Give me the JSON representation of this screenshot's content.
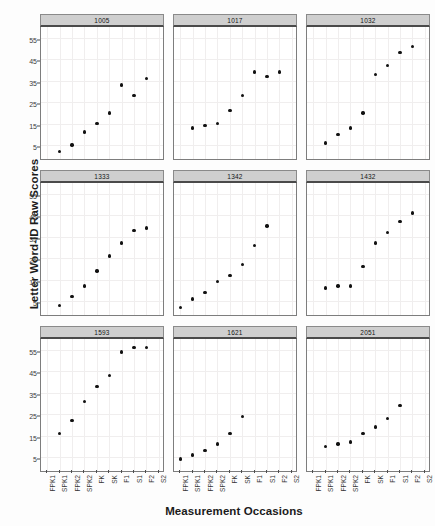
{
  "chart_data": {
    "type": "scatter",
    "title": "",
    "xlabel": "Measurement Occasions",
    "ylabel": "Letter Word-ID Raw Scores",
    "ylim": [
      -2,
      60
    ],
    "yticks": [
      5,
      15,
      25,
      35,
      45,
      55
    ],
    "grid": true,
    "legend_position": "none",
    "facet_layout": {
      "rows": 3,
      "cols": 3
    },
    "categories": [
      "FPK1",
      "SPK1",
      "FPK2",
      "SPK2",
      "FK",
      "SK",
      "F1",
      "S1",
      "F2",
      "S2"
    ],
    "panels": [
      {
        "label": "1005",
        "points": [
          {
            "x": "SPK1",
            "y": 2
          },
          {
            "x": "FPK2",
            "y": 5
          },
          {
            "x": "SPK2",
            "y": 11
          },
          {
            "x": "FK",
            "y": 15
          },
          {
            "x": "SK",
            "y": 20
          },
          {
            "x": "F1",
            "y": 33
          },
          {
            "x": "S1",
            "y": 28
          },
          {
            "x": "F2",
            "y": 36
          }
        ]
      },
      {
        "label": "1017",
        "points": [
          {
            "x": "SPK1",
            "y": 13
          },
          {
            "x": "FPK2",
            "y": 14
          },
          {
            "x": "SPK2",
            "y": 15
          },
          {
            "x": "FK",
            "y": 21
          },
          {
            "x": "SK",
            "y": 28
          },
          {
            "x": "F1",
            "y": 39
          },
          {
            "x": "S1",
            "y": 37
          },
          {
            "x": "F2",
            "y": 39
          }
        ]
      },
      {
        "label": "1032",
        "points": [
          {
            "x": "SPK1",
            "y": 6
          },
          {
            "x": "FPK2",
            "y": 10
          },
          {
            "x": "SPK2",
            "y": 13
          },
          {
            "x": "FK",
            "y": 20
          },
          {
            "x": "SK",
            "y": 38
          },
          {
            "x": "F1",
            "y": 42
          },
          {
            "x": "S1",
            "y": 48
          },
          {
            "x": "F2",
            "y": 51
          }
        ]
      },
      {
        "label": "1333",
        "points": [
          {
            "x": "SPK1",
            "y": 3
          },
          {
            "x": "FPK2",
            "y": 7
          },
          {
            "x": "SPK2",
            "y": 12
          },
          {
            "x": "FK",
            "y": 19
          },
          {
            "x": "SK",
            "y": 26
          },
          {
            "x": "F1",
            "y": 32
          },
          {
            "x": "S1",
            "y": 38
          },
          {
            "x": "F2",
            "y": 39
          }
        ]
      },
      {
        "label": "1342",
        "points": [
          {
            "x": "FPK1",
            "y": 2
          },
          {
            "x": "SPK1",
            "y": 6
          },
          {
            "x": "FPK2",
            "y": 9
          },
          {
            "x": "SPK2",
            "y": 14
          },
          {
            "x": "FK",
            "y": 17
          },
          {
            "x": "SK",
            "y": 22
          },
          {
            "x": "F1",
            "y": 31
          },
          {
            "x": "S1",
            "y": 40
          }
        ]
      },
      {
        "label": "1432",
        "points": [
          {
            "x": "SPK1",
            "y": 11
          },
          {
            "x": "FPK2",
            "y": 12
          },
          {
            "x": "SPK2",
            "y": 12
          },
          {
            "x": "FK",
            "y": 21
          },
          {
            "x": "SK",
            "y": 32
          },
          {
            "x": "F1",
            "y": 37
          },
          {
            "x": "S1",
            "y": 42
          },
          {
            "x": "F2",
            "y": 46
          }
        ]
      },
      {
        "label": "1593",
        "points": [
          {
            "x": "SPK1",
            "y": 16
          },
          {
            "x": "FPK2",
            "y": 22
          },
          {
            "x": "SPK2",
            "y": 31
          },
          {
            "x": "FK",
            "y": 38
          },
          {
            "x": "SK",
            "y": 43
          },
          {
            "x": "F1",
            "y": 54
          },
          {
            "x": "S1",
            "y": 56
          },
          {
            "x": "F2",
            "y": 56
          }
        ]
      },
      {
        "label": "1621",
        "points": [
          {
            "x": "FPK1",
            "y": 4
          },
          {
            "x": "SPK1",
            "y": 6
          },
          {
            "x": "FPK2",
            "y": 8
          },
          {
            "x": "SPK2",
            "y": 11
          },
          {
            "x": "FK",
            "y": 16
          },
          {
            "x": "SK",
            "y": 24
          }
        ]
      },
      {
        "label": "2051",
        "points": [
          {
            "x": "SPK1",
            "y": 10
          },
          {
            "x": "FPK2",
            "y": 11
          },
          {
            "x": "SPK2",
            "y": 12
          },
          {
            "x": "FK",
            "y": 16
          },
          {
            "x": "SK",
            "y": 19
          },
          {
            "x": "F1",
            "y": 23
          },
          {
            "x": "S1",
            "y": 29
          }
        ]
      }
    ]
  }
}
